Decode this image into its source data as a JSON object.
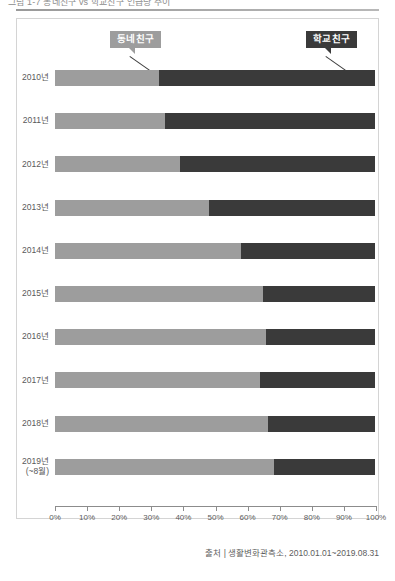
{
  "page": {
    "top_title": "그림 1-7 동네친구 vs 학교친구 언급량 추이"
  },
  "legend": {
    "neighbor": {
      "label": "동네친구",
      "color": "#9d9d9d"
    },
    "school": {
      "label": "학교친구",
      "color": "#3a3a3a"
    }
  },
  "source": {
    "text": "출처 | 생활변화관측소, 2010.01.01~2019.08.31"
  },
  "chart_data": {
    "type": "bar",
    "orientation": "horizontal",
    "stacked": true,
    "normalized_percent": true,
    "title": "",
    "xlabel": "",
    "ylabel": "",
    "xlim": [
      0,
      100
    ],
    "grid": false,
    "legend_position": "top",
    "tick_labels": [
      "0%",
      "10%",
      "20%",
      "30%",
      "40%",
      "50%",
      "60%",
      "70%",
      "80%",
      "90%",
      "100%"
    ],
    "tick_values": [
      0,
      10,
      20,
      30,
      40,
      50,
      60,
      70,
      80,
      90,
      100
    ],
    "categories": [
      "2010년",
      "2011년",
      "2012년",
      "2013년",
      "2014년",
      "2015년",
      "2016년",
      "2017년",
      "2018년",
      "2019년"
    ],
    "category_sublabels": [
      "",
      "",
      "",
      "",
      "",
      "",
      "",
      "",
      "",
      "(~8월)"
    ],
    "series": [
      {
        "name": "동네친구",
        "color": "#9d9d9d",
        "values": [
          32.5,
          34.5,
          39.0,
          48.0,
          58.0,
          65.0,
          66.0,
          64.0,
          66.5,
          68.5
        ]
      },
      {
        "name": "학교친구",
        "color": "#3a3a3a",
        "values": [
          67.5,
          65.5,
          61.0,
          52.0,
          42.0,
          35.0,
          34.0,
          36.0,
          33.5,
          31.5
        ]
      }
    ]
  }
}
